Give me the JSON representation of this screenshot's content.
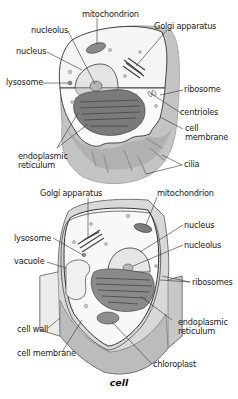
{
  "caption": "cell",
  "animal_cell": {
    "labels": {
      "mitochondrion": "mitochondrion",
      "golgi": "Golgi apparatus",
      "nucleolus": "nucleolus",
      "nucleus": "nucleus",
      "lysosome": "lysosome",
      "ribosome": "ribosome",
      "centrioles": "centrioles",
      "cell_membrane_1": "cell",
      "cell_membrane_2": "membrane",
      "er_1": "endoplasmic",
      "er_2": "reticulum",
      "cilia": "cilia"
    }
  },
  "plant_cell": {
    "labels": {
      "golgi": "Golgi apparatus",
      "mitochondrion": "mitochondrion",
      "lysosome": "lysosome",
      "nucleus": "nucleus",
      "nucleolus": "nucleolus",
      "vacuole": "vacuole",
      "ribosomes": "ribosomes",
      "er_1": "endoplasmic",
      "er_2": "reticulum",
      "cell_wall": "cell wall",
      "cell_membrane": "cell membrane",
      "chloroplast": "chloroplast"
    }
  },
  "colors": {
    "outline": "#333333",
    "cytoplasm": "#f7f7f7",
    "membrane_fill": "#bdbdbd",
    "organelle_dark": "#6e6e6e",
    "organelle_mid": "#9a9a9a",
    "wall_light": "#e2e2e2"
  }
}
